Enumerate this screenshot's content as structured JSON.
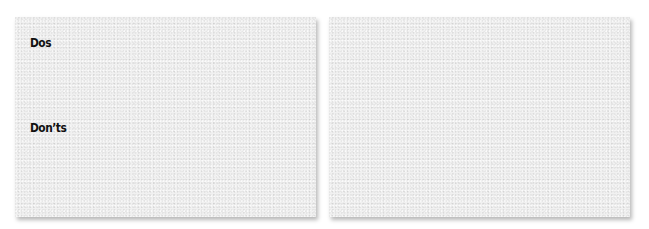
{
  "cards": [
    {
      "id": "left",
      "sections": [
        {
          "label": "Dos"
        },
        {
          "label": "Don’ts"
        }
      ]
    },
    {
      "id": "right",
      "sections": []
    }
  ],
  "colors": {
    "page_background": "#ffffff",
    "card_background": "#f1f1f1",
    "text": "#111111"
  }
}
